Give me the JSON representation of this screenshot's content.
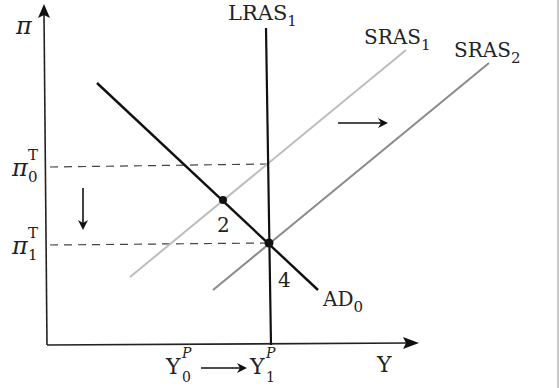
{
  "diagram": {
    "title": "",
    "type": "AD-AS diagram (inflation vs output)",
    "axes": {
      "y_label": "π",
      "x_label": "Y"
    },
    "curves": {
      "lras": {
        "label": "LRAS",
        "sub": "1",
        "color": "#111111"
      },
      "sras1": {
        "label": "SRAS",
        "sub": "1",
        "color": "#bdbdbd"
      },
      "sras2": {
        "label": "SRAS",
        "sub": "2",
        "color": "#8a8a8a"
      },
      "ad0": {
        "label": "AD",
        "sub": "0",
        "color": "#111111"
      }
    },
    "y_ticks": [
      {
        "base": "π",
        "sup": "T",
        "sub": "0"
      },
      {
        "base": "π",
        "sup": "T",
        "sub": "1"
      }
    ],
    "x_ticks": [
      {
        "base": "Y",
        "sup": "P",
        "sub": "0"
      },
      {
        "base": "Y",
        "sup": "P",
        "sub": "1"
      }
    ],
    "points": [
      {
        "label": "2"
      },
      {
        "label": "4"
      }
    ],
    "annotations": {
      "shift_right_arrow": "SRAS shifts right",
      "down_arrow": "target inflation falls",
      "x_shift_arrow": "potential output rises"
    }
  }
}
